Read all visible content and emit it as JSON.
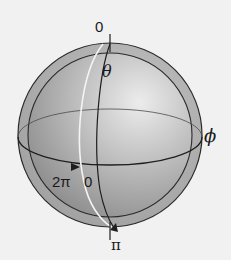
{
  "diagram": {
    "type": "sphere-coordinate-diagram",
    "labels": {
      "theta_start": "0",
      "theta_symbol": "θ",
      "theta_end": "π",
      "phi_symbol": "ϕ",
      "phi_start": "0",
      "phi_end": "2π"
    },
    "colors": {
      "background": "#f1f1f1",
      "shell": "#a9a9a9",
      "sphere_light": "#e6e6e6",
      "sphere_dark": "#8a8a8a",
      "lines": "#2a2a2a",
      "meridian_highlight": "#f4f4f4"
    }
  }
}
